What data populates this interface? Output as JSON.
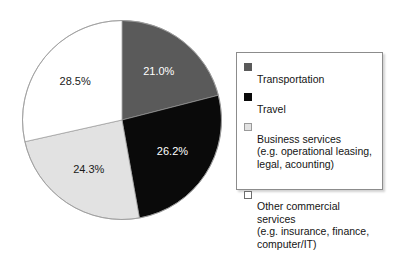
{
  "chart_data": {
    "type": "pie",
    "title": "",
    "labels": [
      "Transportation",
      "Travel",
      "Business services",
      "Other commercial services"
    ],
    "values": [
      21.0,
      26.2,
      24.3,
      28.5
    ],
    "value_labels": [
      "21.0%",
      "26.2%",
      "24.3%",
      "28.5%"
    ],
    "colors": [
      "#5a5a5a",
      "#0a0a0a",
      "#e2e2e2",
      "#ffffff"
    ],
    "label_text_colors": [
      "#ffffff",
      "#ffffff",
      "#1a1a1a",
      "#1a1a1a"
    ],
    "start_angle_deg": 0,
    "direction": "clockwise",
    "legend_position": "right",
    "grid": false,
    "xlabel": "",
    "ylabel": ""
  },
  "pie": {
    "slices": [
      {
        "name": "transportation",
        "label": "21.0%",
        "percent": 21.0,
        "color": "#5a5a5a",
        "text_color": "#ffffff"
      },
      {
        "name": "travel",
        "label": "26.2%",
        "percent": 26.2,
        "color": "#0a0a0a",
        "text_color": "#ffffff"
      },
      {
        "name": "business-services",
        "label": "24.3%",
        "percent": 24.3,
        "color": "#e2e2e2",
        "text_color": "#1a1a1a"
      },
      {
        "name": "other-commercial-services",
        "label": "28.5%",
        "percent": 28.5,
        "color": "#ffffff",
        "text_color": "#1a1a1a"
      }
    ],
    "outline_color": "#9a9a9a"
  },
  "legend": {
    "items": [
      {
        "swatch": "dark-gray",
        "primary": "Transportation",
        "detail": ""
      },
      {
        "swatch": "black",
        "primary": "Travel",
        "detail": ""
      },
      {
        "swatch": "light-gray",
        "primary": "Business services",
        "detail": "(e.g. operational leasing,\nlegal, acounting)"
      },
      {
        "swatch": "white",
        "primary": "Other commercial services",
        "detail": "(e.g. insurance, finance,\ncomputer/IT)"
      }
    ]
  }
}
